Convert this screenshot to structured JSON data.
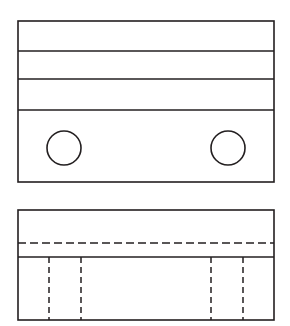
{
  "sheet": {
    "title": "Orthographic Projection - Two View Drawing",
    "background_color": "#ffffff",
    "line_color": "#231f20",
    "width": 290,
    "height": 326
  },
  "views": [
    {
      "name": "top-view",
      "label": "Top View",
      "outline": {
        "x": 18,
        "y": 21,
        "width": 256,
        "height": 161
      },
      "horizontal_divider_lines": [
        {
          "name": "divider-line-1",
          "y": 51,
          "x1": 18,
          "x2": 274,
          "style": "solid"
        },
        {
          "name": "divider-line-2",
          "y": 79,
          "x1": 18,
          "x2": 274,
          "style": "solid"
        },
        {
          "name": "divider-line-3",
          "y": 110,
          "x1": 18,
          "x2": 274,
          "style": "solid"
        }
      ],
      "circles": [
        {
          "name": "hole-left",
          "cx": 64,
          "cy": 148,
          "r": 17
        },
        {
          "name": "hole-right",
          "cx": 228,
          "cy": 148,
          "r": 17
        }
      ]
    },
    {
      "name": "front-view",
      "label": "Front View",
      "outline": {
        "x": 18,
        "y": 210,
        "width": 256,
        "height": 110
      },
      "horizontal_divider_lines": [
        {
          "name": "hidden-edge-line",
          "y": 243,
          "x1": 18,
          "x2": 274,
          "style": "dashed"
        },
        {
          "name": "step-line",
          "y": 257,
          "x1": 18,
          "x2": 274,
          "style": "solid"
        }
      ],
      "vertical_hidden_lines": [
        {
          "name": "hidden-line-1",
          "x": 49,
          "y1": 257,
          "y2": 320
        },
        {
          "name": "hidden-line-2",
          "x": 81,
          "y1": 257,
          "y2": 320
        },
        {
          "name": "hidden-line-3",
          "x": 211,
          "y1": 257,
          "y2": 320
        },
        {
          "name": "hidden-line-4",
          "x": 243,
          "y1": 257,
          "y2": 320
        }
      ]
    }
  ],
  "line_styles": {
    "visible_dash": "none",
    "hidden_dash_horizontal": "8 4",
    "hidden_dash_vertical": "6 4"
  }
}
